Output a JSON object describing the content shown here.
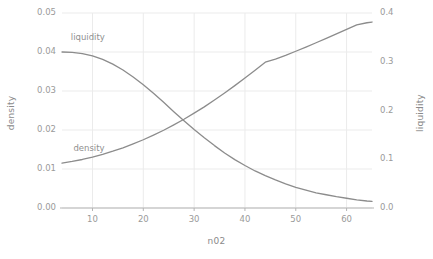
{
  "chart_data": {
    "type": "line",
    "title": "",
    "xlabel": "n02",
    "ylabel": "density",
    "y2label": "liquidity",
    "grid": true,
    "legend_position": "inline-annotations",
    "xlim": [
      4,
      65
    ],
    "ylim": [
      0.0,
      0.05
    ],
    "y2lim": [
      0.0,
      0.4
    ],
    "x_ticks": [
      10,
      20,
      30,
      40,
      50,
      60
    ],
    "x_tick_labels": [
      "10",
      "20",
      "30",
      "40",
      "50",
      "60"
    ],
    "y_ticks": [
      0.0,
      0.01,
      0.02,
      0.03,
      0.04,
      0.05
    ],
    "y_tick_labels": [
      "0.00",
      "0.01",
      "0.02",
      "0.03",
      "0.04",
      "0.05"
    ],
    "y2_ticks": [
      0.0,
      0.1,
      0.2,
      0.3,
      0.4
    ],
    "y2_tick_labels": [
      "0.0",
      "0.1",
      "0.2",
      "0.3",
      "0.4"
    ],
    "annotations": [
      {
        "text": "liquidity",
        "x": 8.5,
        "y": 0.0435,
        "axis": "left"
      },
      {
        "text": "density",
        "x": 9.0,
        "y": 0.0152,
        "axis": "left"
      }
    ],
    "series": [
      {
        "name": "liquidity",
        "axis": "left",
        "color": "#8c8c8c",
        "x": [
          4,
          6,
          8,
          10,
          12,
          14,
          16,
          18,
          20,
          22,
          24,
          26,
          28,
          30,
          32,
          34,
          36,
          38,
          40,
          42,
          44,
          46,
          48,
          50,
          52,
          54,
          56,
          58,
          60,
          62,
          64,
          65
        ],
        "values": [
          0.04,
          0.0399,
          0.0396,
          0.039,
          0.0381,
          0.0369,
          0.0354,
          0.0336,
          0.0316,
          0.0294,
          0.0271,
          0.0247,
          0.0224,
          0.0201,
          0.018,
          0.016,
          0.0141,
          0.0124,
          0.0109,
          0.0095,
          0.0083,
          0.0072,
          0.0062,
          0.0053,
          0.0046,
          0.0039,
          0.0034,
          0.0029,
          0.0025,
          0.0021,
          0.0018,
          0.0017
        ]
      },
      {
        "name": "density",
        "axis": "right",
        "color": "#8c8c8c",
        "x": [
          4,
          6,
          8,
          10,
          12,
          14,
          16,
          18,
          20,
          22,
          24,
          26,
          28,
          30,
          32,
          34,
          36,
          38,
          40,
          42,
          44,
          46,
          48,
          50,
          52,
          54,
          56,
          58,
          60,
          62,
          64,
          65
        ],
        "values": [
          0.092,
          0.0955,
          0.0995,
          0.1045,
          0.11,
          0.1165,
          0.1235,
          0.1315,
          0.14,
          0.1495,
          0.1595,
          0.1705,
          0.182,
          0.1945,
          0.2075,
          0.2215,
          0.236,
          0.251,
          0.2665,
          0.2825,
          0.299,
          0.3055,
          0.313,
          0.3215,
          0.33,
          0.339,
          0.348,
          0.357,
          0.3665,
          0.3755,
          0.38,
          0.3815
        ]
      }
    ]
  },
  "axis_titles": {
    "left": "density",
    "right": "liquidity",
    "bottom": "n02"
  },
  "colors": {
    "line": "#8c8c8c",
    "grid": "#ebebeb",
    "axis": "#b5b5b5",
    "text": "#909090",
    "background": "#ffffff"
  }
}
